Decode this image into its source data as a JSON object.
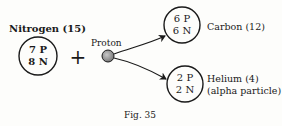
{
  "figure": {
    "caption": "Fig. 35",
    "reactant": {
      "label": "Nitrogen (15)",
      "line1": "7 P",
      "line2": "8 N"
    },
    "operator": "+",
    "projectile": {
      "label": "Proton"
    },
    "products": [
      {
        "label": "Carbon (12)",
        "sublabel": "",
        "line1": "6 P",
        "line2": "6 N"
      },
      {
        "label": "Helium (4)",
        "sublabel": "(alpha particle)",
        "line1": "2 P",
        "line2": "2 N"
      }
    ],
    "colors": {
      "ink": "#1a1a1a",
      "proton_fill": "#9a9a9a",
      "background": "#fdfdfb"
    }
  }
}
